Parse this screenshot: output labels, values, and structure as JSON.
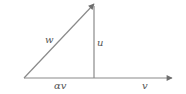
{
  "diagram": {
    "type": "vector-projection",
    "colors": {
      "line": "#8a8a8a",
      "arrow": "#6e6e6e",
      "text": "#555555"
    },
    "labels": {
      "w": "w",
      "u": "u",
      "alpha_v": "αv",
      "v": "v"
    }
  }
}
